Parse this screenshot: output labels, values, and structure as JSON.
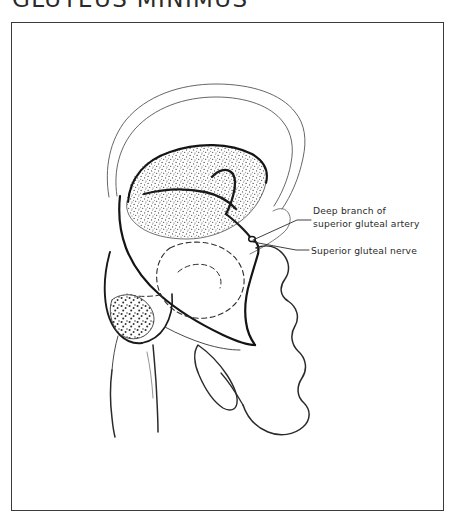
{
  "plate": {
    "title": "GLUTEUS MINIMUS",
    "subject": "gluteus-minimus-attachments",
    "view": "lateral view of right hip bone and proximal femur",
    "background_color": "#ffffff",
    "ink_color": "#1a1a1a",
    "frame_color": "#3a3a3a"
  },
  "labels": {
    "artery_line1": "Deep branch of",
    "artery_line2": "superior gluteal artery",
    "nerve": "Superior gluteal nerve"
  },
  "structures": [
    {
      "name": "iliac-crest",
      "style": "double-outline"
    },
    {
      "name": "ilium-gluteal-surface",
      "style": "outline"
    },
    {
      "name": "gluteus-minimus-origin",
      "style": "stipple"
    },
    {
      "name": "gluteus-minimus-insertion",
      "style": "stipple-coarse"
    },
    {
      "name": "greater-trochanter",
      "style": "outline"
    },
    {
      "name": "femoral-head-and-neck",
      "style": "outline"
    },
    {
      "name": "femoral-shaft",
      "style": "outline"
    },
    {
      "name": "acetabulum",
      "style": "dashed"
    },
    {
      "name": "obturator-foramen",
      "style": "outline"
    },
    {
      "name": "ischium-and-pubis",
      "style": "outline"
    },
    {
      "name": "superior-gluteal-artery-deep-branch",
      "style": "heavy-line"
    },
    {
      "name": "superior-gluteal-nerve",
      "style": "heavy-line"
    }
  ]
}
